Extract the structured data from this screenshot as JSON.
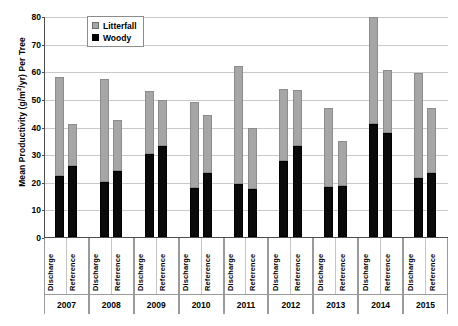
{
  "chart_data": {
    "type": "bar",
    "stacked": true,
    "title": "",
    "xlabel": "",
    "ylabel": "Mean Productivity (g/m²/yr) Per Tree",
    "ylim": [
      0,
      80
    ],
    "ytick_step": 10,
    "yticks": [
      "0",
      "10",
      "20",
      "30",
      "40",
      "50",
      "60",
      "70",
      "80"
    ],
    "grid": "horizontal",
    "legend_position": "top-left-inside",
    "legend": [
      {
        "name": "Litterfall",
        "color": "#a6a6a6"
      },
      {
        "name": "Woody",
        "color": "#000000"
      }
    ],
    "groups": [
      "2007",
      "2008",
      "2009",
      "2010",
      "2011",
      "2012",
      "2013",
      "2014",
      "2015"
    ],
    "subcategories": [
      "Discharge",
      "Reference"
    ],
    "series": [
      {
        "name": "Woody",
        "color": "#000000",
        "values": [
          22.2,
          25.8,
          19.8,
          23.8,
          30.2,
          32.8,
          17.6,
          23.0,
          19.2,
          17.5,
          27.6,
          33.0,
          18.2,
          18.5,
          40.8,
          37.8,
          21.2,
          23.2
        ]
      },
      {
        "name": "Litterfall",
        "color": "#a6a6a6",
        "values": [
          35.8,
          15.2,
          37.4,
          18.7,
          22.8,
          16.7,
          31.3,
          21.1,
          42.8,
          22.1,
          25.9,
          20.1,
          28.6,
          16.2,
          38.9,
          22.8,
          38.1,
          23.6
        ]
      }
    ],
    "bars": [
      {
        "group": "2007",
        "sub": "Discharge",
        "woody": 22.2,
        "litterfall": 35.8,
        "total": 58.0
      },
      {
        "group": "2007",
        "sub": "Reference",
        "woody": 25.8,
        "litterfall": 15.2,
        "total": 41.0
      },
      {
        "group": "2008",
        "sub": "Discharge",
        "woody": 19.8,
        "litterfall": 37.4,
        "total": 57.2
      },
      {
        "group": "2008",
        "sub": "Reference",
        "woody": 23.8,
        "litterfall": 18.7,
        "total": 42.5
      },
      {
        "group": "2009",
        "sub": "Discharge",
        "woody": 30.2,
        "litterfall": 22.8,
        "total": 53.0
      },
      {
        "group": "2009",
        "sub": "Reference",
        "woody": 32.8,
        "litterfall": 16.7,
        "total": 49.5
      },
      {
        "group": "2010",
        "sub": "Discharge",
        "woody": 17.6,
        "litterfall": 31.3,
        "total": 48.9
      },
      {
        "group": "2010",
        "sub": "Reference",
        "woody": 23.0,
        "litterfall": 21.1,
        "total": 44.1
      },
      {
        "group": "2011",
        "sub": "Discharge",
        "woody": 19.2,
        "litterfall": 42.8,
        "total": 62.0
      },
      {
        "group": "2011",
        "sub": "Reference",
        "woody": 17.5,
        "litterfall": 22.1,
        "total": 39.6
      },
      {
        "group": "2012",
        "sub": "Discharge",
        "woody": 27.6,
        "litterfall": 25.9,
        "total": 53.5
      },
      {
        "group": "2012",
        "sub": "Reference",
        "woody": 33.0,
        "litterfall": 20.1,
        "total": 53.1
      },
      {
        "group": "2013",
        "sub": "Discharge",
        "woody": 18.2,
        "litterfall": 28.6,
        "total": 46.8
      },
      {
        "group": "2013",
        "sub": "Reference",
        "woody": 18.5,
        "litterfall": 16.2,
        "total": 34.7
      },
      {
        "group": "2014",
        "sub": "Discharge",
        "woody": 40.8,
        "litterfall": 38.9,
        "total": 79.7
      },
      {
        "group": "2014",
        "sub": "Reference",
        "woody": 37.8,
        "litterfall": 22.8,
        "total": 60.6
      },
      {
        "group": "2015",
        "sub": "Discharge",
        "woody": 21.2,
        "litterfall": 38.1,
        "total": 59.3
      },
      {
        "group": "2015",
        "sub": "Reference",
        "woody": 23.2,
        "litterfall": 23.6,
        "total": 46.8
      }
    ]
  },
  "axis": {
    "y_title_main": "Mean Productivity (g/m",
    "y_title_sup": "2",
    "y_title_tail": "/yr) Per Tree"
  }
}
